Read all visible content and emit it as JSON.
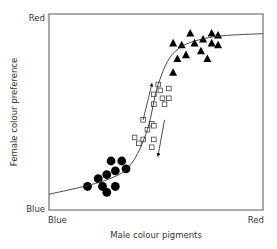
{
  "chart_data": {
    "type": "scatter",
    "title": "",
    "xlabel": "Male colour pigments",
    "ylabel": "Female colour preference",
    "x_ticks": {
      "min_label": "Blue",
      "max_label": "Red"
    },
    "y_ticks": {
      "min_label": "Blue",
      "max_label": "Red"
    },
    "xlim": [
      0,
      100
    ],
    "ylim": [
      0,
      100
    ],
    "grid": false,
    "legend": null,
    "series": [
      {
        "name": "Blue population",
        "marker": "filled-circle",
        "points": [
          [
            18,
            12
          ],
          [
            23,
            16
          ],
          [
            25,
            12
          ],
          [
            27,
            9
          ],
          [
            27,
            18
          ],
          [
            31,
            20
          ],
          [
            31,
            12
          ],
          [
            29,
            25
          ],
          [
            34,
            25
          ],
          [
            36,
            21
          ]
        ]
      },
      {
        "name": "Intermediate population",
        "marker": "open-square",
        "points": [
          [
            51,
            64
          ],
          [
            56,
            62
          ],
          [
            52,
            61
          ],
          [
            49,
            59
          ],
          [
            53,
            57
          ],
          [
            56,
            57
          ],
          [
            49,
            54
          ],
          [
            54,
            54
          ],
          [
            44,
            46
          ],
          [
            48,
            44
          ],
          [
            49,
            43
          ],
          [
            46,
            41
          ],
          [
            40,
            37
          ],
          [
            44,
            36
          ],
          [
            49,
            36
          ],
          [
            42,
            34
          ],
          [
            48,
            32
          ]
        ]
      },
      {
        "name": "Red population",
        "marker": "filled-triangle",
        "points": [
          [
            66,
            90
          ],
          [
            76,
            90
          ],
          [
            79,
            89
          ],
          [
            58,
            85
          ],
          [
            62,
            84
          ],
          [
            68,
            85
          ],
          [
            72,
            87
          ],
          [
            76,
            85
          ],
          [
            79,
            84
          ],
          [
            71,
            81
          ],
          [
            64,
            79
          ],
          [
            60,
            77
          ],
          [
            74,
            77
          ],
          [
            58,
            70
          ]
        ]
      },
      {
        "name": "Preference curve",
        "type": "line",
        "points": [
          [
            0,
            8
          ],
          [
            26,
            15
          ],
          [
            38,
            23
          ],
          [
            46,
            41
          ],
          [
            51,
            64
          ],
          [
            59,
            81
          ],
          [
            75,
            88
          ],
          [
            100,
            90
          ]
        ]
      }
    ],
    "annotations": [
      {
        "type": "arrow",
        "direction": "up",
        "from": [
          44,
          46
        ],
        "to": [
          48,
          64
        ]
      },
      {
        "type": "arrow",
        "direction": "down",
        "from": [
          54,
          46
        ],
        "to": [
          51,
          28
        ]
      }
    ]
  },
  "labels": {
    "y_top": "Red",
    "y_bottom": "Blue",
    "x_left": "Blue",
    "x_right": "Red",
    "x_axis_title": "Male colour pigments",
    "y_axis_title": "Female colour preference"
  }
}
